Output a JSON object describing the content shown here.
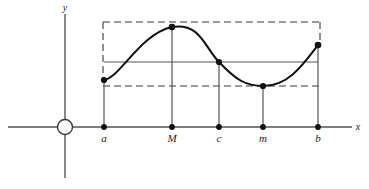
{
  "figure": {
    "kind": "calculus-diagram",
    "background_color": "#ffffff",
    "stroke_color": "#1b1b1b",
    "axis_color": "#55555a",
    "curve_color": "#111111",
    "dash_color": "#3a3a3a"
  },
  "axes": {
    "x_label": "x",
    "y_label": "y",
    "origin_marker": "circle-origin-marker"
  },
  "points": [
    {
      "label": "a",
      "x": 104,
      "y": 80,
      "role": "left-endpoint"
    },
    {
      "label": "M",
      "x": 172,
      "y": 27,
      "role": "maximum"
    },
    {
      "label": "c",
      "x": 219,
      "y": 62,
      "role": "intermediate-value"
    },
    {
      "label": "m",
      "x": 263,
      "y": 86,
      "role": "minimum"
    },
    {
      "label": "b",
      "x": 318,
      "y": 45,
      "role": "right-endpoint"
    }
  ],
  "axis_ticks": [
    {
      "label": "a",
      "x": 104
    },
    {
      "label": "M",
      "x": 172
    },
    {
      "label": "c",
      "x": 219
    },
    {
      "label": "m",
      "x": 263
    },
    {
      "label": "b",
      "x": 318
    }
  ],
  "lines": {
    "dashed_top_level_y": 22,
    "dashed_bottom_level_y": 86,
    "solid_level_y": 62,
    "x_axis_y": 127
  }
}
